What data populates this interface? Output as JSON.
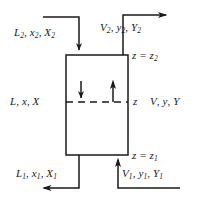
{
  "diagram": {
    "colors": {
      "line": "#1a1a1a",
      "text": "#1a1a1a",
      "background": "#ffffff"
    },
    "column": {
      "name": "column-vessel",
      "x": 66,
      "y": 55,
      "width": 62,
      "height": 100
    },
    "labels": {
      "liquid_in": {
        "var1": "L",
        "sub1": "2",
        "var2": "x",
        "sub2": "2",
        "var3": "X",
        "sub3": "2"
      },
      "vapor_out": {
        "var1": "V",
        "sub1": "2",
        "var2": "y",
        "sub2": "2",
        "var3": "Y",
        "sub3": "2"
      },
      "liquid_mid": {
        "var1": "L",
        "sub1": "",
        "var2": "x",
        "sub2": "",
        "var3": "X",
        "sub3": ""
      },
      "vapor_mid": {
        "var1": "V",
        "sub1": "",
        "var2": "y",
        "sub2": "",
        "var3": "Y",
        "sub3": ""
      },
      "liquid_out": {
        "var1": "L",
        "sub1": "1",
        "var2": "x",
        "sub2": "1",
        "var3": "X",
        "sub3": "1"
      },
      "vapor_in": {
        "var1": "V",
        "sub1": "1",
        "var2": "y",
        "sub2": "1",
        "var3": "Y",
        "sub3": "1"
      },
      "z_top": {
        "text": "z = z",
        "sub": "2"
      },
      "z_mid": {
        "text": "z",
        "sub": ""
      },
      "z_bottom": {
        "text": "z = z",
        "sub": "1"
      },
      "separator": ", "
    },
    "streams": [
      {
        "name": "liquid-inlet-stream",
        "direction": "down-into-top-left",
        "arrow": "down"
      },
      {
        "name": "vapor-outlet-stream",
        "direction": "up-out-of-top-right",
        "arrow": "right"
      },
      {
        "name": "liquid-outlet-stream",
        "direction": "down-out-of-bottom-left",
        "arrow": "left"
      },
      {
        "name": "vapor-inlet-stream",
        "direction": "up-into-bottom-right",
        "arrow": "up"
      },
      {
        "name": "internal-liquid-flow-arrow",
        "direction": "down",
        "arrow": "down"
      },
      {
        "name": "internal-vapor-flow-arrow",
        "direction": "up",
        "arrow": "up"
      }
    ]
  }
}
